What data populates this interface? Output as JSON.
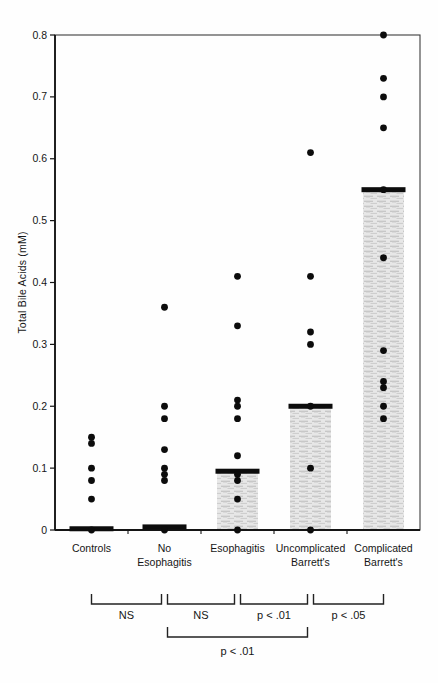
{
  "chart_data": {
    "type": "scatter",
    "title": "",
    "ylabel": "Total Bile Acids (mM)",
    "xlabel": "",
    "ylim": [
      0,
      0.8
    ],
    "yticks": [
      0,
      0.1,
      0.2,
      0.3,
      0.4,
      0.5,
      0.6,
      0.7,
      0.8
    ],
    "ytick_labels": [
      "0",
      "0.1",
      "0.2",
      "0.3",
      "0.4",
      "0.5",
      "0.6",
      "0.7",
      "0.8"
    ],
    "grid": false,
    "legend": "none",
    "groups": [
      {
        "label_lines": [
          "Controls"
        ],
        "points": [
          0.15,
          0.14,
          0.1,
          0.08,
          0.05,
          0.0
        ],
        "median": 0.002,
        "has_range_bar": false
      },
      {
        "label_lines": [
          "No",
          "Esophagitis"
        ],
        "points": [
          0.36,
          0.2,
          0.18,
          0.13,
          0.1,
          0.09,
          0.08,
          0.0
        ],
        "median": 0.005,
        "has_range_bar": false
      },
      {
        "label_lines": [
          "Esophagitis"
        ],
        "points": [
          0.41,
          0.33,
          0.21,
          0.2,
          0.18,
          0.12,
          0.09,
          0.08,
          0.05,
          0.0
        ],
        "median": 0.095,
        "has_range_bar": true
      },
      {
        "label_lines": [
          "Uncomplicated",
          "Barrett's"
        ],
        "points": [
          0.61,
          0.41,
          0.32,
          0.3,
          0.2,
          0.1,
          0.0
        ],
        "median": 0.2,
        "has_range_bar": true
      },
      {
        "label_lines": [
          "Complicated",
          "Barrett's"
        ],
        "points": [
          0.8,
          0.73,
          0.7,
          0.65,
          0.55,
          0.44,
          0.29,
          0.24,
          0.23,
          0.2,
          0.18
        ],
        "median": 0.55,
        "has_range_bar": true
      }
    ],
    "comparisons": [
      {
        "from": 0,
        "to": 1,
        "label": "NS",
        "row": 1
      },
      {
        "from": 1,
        "to": 2,
        "label": "NS",
        "row": 1
      },
      {
        "from": 2,
        "to": 3,
        "label": "p < .01",
        "row": 1
      },
      {
        "from": 3,
        "to": 4,
        "label": "p < .05",
        "row": 1
      },
      {
        "from": 1,
        "to": 3,
        "label": "p < .01",
        "row": 2
      }
    ],
    "colors": {
      "dot": "#0c0c0c",
      "median_bar": "#0c0c0c",
      "range_fill": "#e7e7e7",
      "range_stripe": "#c0c0c0",
      "range_stripe_light": "#d6d6d6",
      "axis": "#141414",
      "frame": "#3c3c3c",
      "bracket": "#222222"
    }
  }
}
